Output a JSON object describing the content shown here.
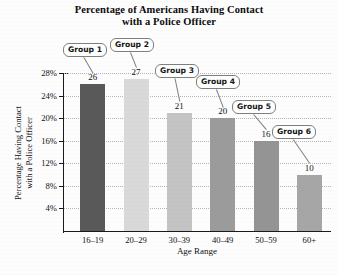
{
  "chart_data": {
    "type": "bar",
    "title": "Percentage of Americans Having Contact with a Police Officer",
    "title_lines": [
      "Percentage of Americans Having Contact",
      "with a Police Officer"
    ],
    "xlabel": "Age Range",
    "ylabel": "Percentage Having Contact with a Police Officer",
    "ylabel_lines": [
      "Percentage Having Contact",
      "with a Police Officer"
    ],
    "categories": [
      "16–19",
      "20–29",
      "30–39",
      "40–49",
      "50–59",
      "60+"
    ],
    "values": [
      26,
      27,
      21,
      20,
      16,
      10
    ],
    "value_labels": [
      "26",
      "27",
      "21",
      "20",
      "16",
      "10"
    ],
    "ylim": [
      0,
      28
    ],
    "yticks": [
      4,
      8,
      12,
      16,
      20,
      24,
      28
    ],
    "ytick_labels": [
      "4%",
      "8%",
      "12%",
      "16%",
      "20%",
      "24%",
      "28%"
    ],
    "grid": true,
    "legend": "none",
    "bar_colors": [
      "#595959",
      "#d9d9d9",
      "#c4c4c4",
      "#9b9b9b",
      "#949494",
      "#a6a6a6"
    ],
    "annotations": [
      {
        "label": "Group 1",
        "target_category": "16–19"
      },
      {
        "label": "Group 2",
        "target_category": "20–29"
      },
      {
        "label": "Group 3",
        "target_category": "30–39"
      },
      {
        "label": "Group 4",
        "target_category": "40–49"
      },
      {
        "label": "Group 5",
        "target_category": "50–59"
      },
      {
        "label": "Group 6",
        "target_category": "60+"
      }
    ]
  },
  "callouts": {
    "g1": "Group 1",
    "g2": "Group 2",
    "g3": "Group 3",
    "g4": "Group 4",
    "g5": "Group 5",
    "g6": "Group 6"
  },
  "source": {
    "text": ""
  }
}
